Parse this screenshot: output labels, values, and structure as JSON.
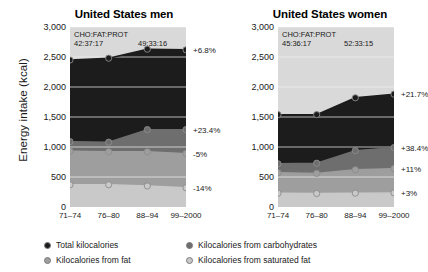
{
  "axis": {
    "ylabel": "Energy intake (kcal)",
    "yticks": [
      "3,000",
      "2,500",
      "2,000",
      "1,500",
      "1,000",
      "500",
      "0"
    ],
    "ytick_values": [
      3000,
      2500,
      2000,
      1500,
      1000,
      500,
      0
    ],
    "categories": [
      "71–74",
      "76–80",
      "88–94",
      "99–2000"
    ]
  },
  "legend": {
    "total": "Total kilocalories",
    "carbs": "Kilocalories from carbohydrates",
    "fat": "Kilocalories from fat",
    "satfat": "Kilocalories from saturated fat"
  },
  "colors": {
    "total": "#1c1c1c",
    "carbs": "#6e6e6e",
    "fat": "#9e9e9e",
    "satfat": "#c9c9c9",
    "plot_bg": "#d9d9d9",
    "gridline": "#f2f2f2"
  },
  "panels": {
    "men": {
      "title": "United States men",
      "ratio_head": "CHO:FAT:PROT",
      "ratio_first": "42:37:17",
      "ratio_last": "49:33:16",
      "pct": {
        "total": "+6.8%",
        "carbs": "+23.4%",
        "fat": "-5%",
        "satfat": "-14%"
      }
    },
    "women": {
      "title": "United States women",
      "ratio_head": "CHO:FAT:PROT",
      "ratio_first": "45:36:17",
      "ratio_last": "52:33:15",
      "pct": {
        "total": "+21.7%",
        "carbs": "+38.4%",
        "fat": "+11%",
        "satfat": "+3%"
      }
    }
  },
  "chart_data": [
    {
      "type": "area",
      "title": "United States men",
      "xlabel": "",
      "ylabel": "Energy intake (kcal)",
      "ylim": [
        0,
        3000
      ],
      "grid": true,
      "legend_position": "bottom",
      "categories": [
        "71–74",
        "76–80",
        "88–94",
        "99–2000"
      ],
      "series": [
        {
          "name": "Total kilocalories",
          "values": [
            2450,
            2480,
            2630,
            2620
          ],
          "change": "+6.8%",
          "color": "#1c1c1c"
        },
        {
          "name": "Kilocalories from carbohydrates",
          "values": [
            1090,
            1080,
            1290,
            1290
          ],
          "change": "+23.4%",
          "color": "#6e6e6e"
        },
        {
          "name": "Kilocalories from fat",
          "values": [
            930,
            920,
            920,
            890
          ],
          "change": "-5%",
          "color": "#9e9e9e"
        },
        {
          "name": "Kilocalories from saturated fat",
          "values": [
            370,
            370,
            350,
            320
          ],
          "change": "-14%",
          "color": "#c9c9c9"
        }
      ],
      "annotations": [
        "CHO:FAT:PROT",
        "42:37:17",
        "49:33:16"
      ]
    },
    {
      "type": "area",
      "title": "United States women",
      "xlabel": "",
      "ylabel": "Energy intake (kcal)",
      "ylim": [
        0,
        3000
      ],
      "grid": true,
      "legend_position": "bottom",
      "categories": [
        "71–74",
        "76–80",
        "88–94",
        "99–2000"
      ],
      "series": [
        {
          "name": "Total kilocalories",
          "values": [
            1540,
            1540,
            1820,
            1880
          ],
          "change": "+21.7%",
          "color": "#1c1c1c"
        },
        {
          "name": "Kilocalories from carbohydrates",
          "values": [
            720,
            730,
            940,
            990
          ],
          "change": "+38.4%",
          "color": "#6e6e6e"
        },
        {
          "name": "Kilocalories from fat",
          "values": [
            570,
            560,
            620,
            640
          ],
          "change": "+11%",
          "color": "#9e9e9e"
        },
        {
          "name": "Kilocalories from saturated fat",
          "values": [
            230,
            225,
            230,
            235
          ],
          "change": "+3%",
          "color": "#c9c9c9"
        }
      ],
      "annotations": [
        "CHO:FAT:PROT",
        "45:36:17",
        "52:33:15"
      ]
    }
  ]
}
